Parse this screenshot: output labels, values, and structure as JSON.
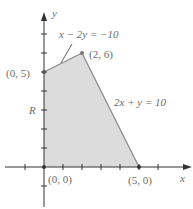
{
  "diagram": {
    "axes": {
      "x_label": "x",
      "y_label": "y"
    },
    "region_label": "R",
    "vertices": [
      {
        "label": "(0, 0)",
        "x": 0,
        "y": 0
      },
      {
        "label": "(0, 5)",
        "x": 0,
        "y": 5
      },
      {
        "label": "(2, 6)",
        "x": 2,
        "y": 6
      },
      {
        "label": "(5, 0)",
        "x": 5,
        "y": 0
      }
    ],
    "equations": {
      "upper": "x − 2y = −10",
      "right": "2x + y = 10"
    },
    "colors": {
      "region_fill": "#dcdcdc",
      "boundary": "#8a8a8a",
      "axis": "#333333",
      "text": "#6b6b6b"
    }
  }
}
